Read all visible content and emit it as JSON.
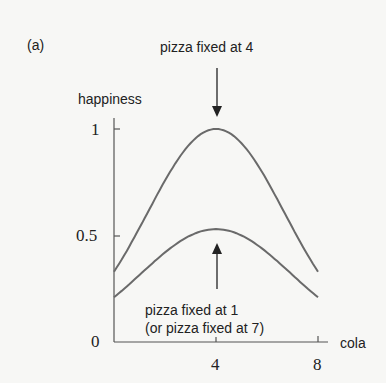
{
  "chart_data": {
    "type": "line",
    "panel_label": "(a)",
    "title": "",
    "xlabel": "cola",
    "ylabel": "happiness",
    "xlim": [
      0,
      8
    ],
    "ylim": [
      0,
      1
    ],
    "x_ticks": [
      "4",
      "8"
    ],
    "y_ticks": [
      "0",
      "0.5",
      "1"
    ],
    "grid": false,
    "x": [
      0,
      1,
      2,
      3,
      4,
      5,
      6,
      7,
      8
    ],
    "series": [
      {
        "name": "pizza fixed at 4",
        "values": [
          0.33,
          0.54,
          0.76,
          0.93,
          1.0,
          0.93,
          0.76,
          0.54,
          0.33
        ]
      },
      {
        "name": "pizza fixed at 1 (or pizza fixed at 7)",
        "values": [
          0.21,
          0.32,
          0.42,
          0.5,
          0.53,
          0.5,
          0.42,
          0.32,
          0.21
        ]
      }
    ],
    "annotations": [
      {
        "text": "pizza fixed at 4",
        "points_to": "upper curve peak at cola=4",
        "arrow": "down"
      },
      {
        "text_line1": "pizza fixed at 1",
        "text_line2": "(or pizza fixed at 7)",
        "points_to": "lower curve peak at cola=4",
        "arrow": "up"
      }
    ]
  },
  "labels": {
    "panel": "(a)",
    "top_annotation": "pizza fixed at 4",
    "ylabel": "happiness",
    "xlabel": "cola",
    "y1": "1",
    "y05": "0.5",
    "y0": "0",
    "x4": "4",
    "x8": "8",
    "bottom_annotation_1": "pizza fixed at 1",
    "bottom_annotation_2": "(or pizza fixed at 7)"
  },
  "colors": {
    "curve": "#6a6a6a",
    "axis": "#555555",
    "text": "#222222"
  }
}
